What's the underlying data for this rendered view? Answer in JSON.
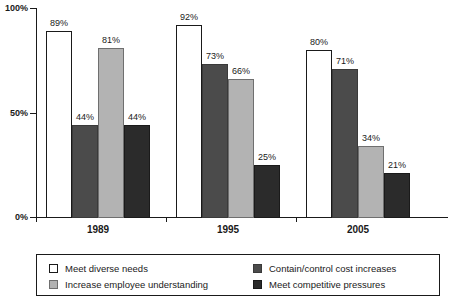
{
  "chart_data": {
    "type": "bar",
    "title": "",
    "subtitle": "",
    "xlabel": "",
    "ylabel": "",
    "categories": [
      "1989",
      "1995",
      "2005"
    ],
    "ylim": [
      0,
      100
    ],
    "yticks": [
      "0%",
      "50%",
      "100%"
    ],
    "ytick_values": [
      0,
      50,
      100
    ],
    "grid": false,
    "legend_position": "bottom",
    "value_label_suffix": "%",
    "series": [
      {
        "name": "Meet diverse needs",
        "swatch": "s0",
        "color": "#ffffff",
        "values": [
          89,
          92,
          80
        ],
        "labels": [
          "89%",
          "92%",
          "80%"
        ]
      },
      {
        "name": "Contain/control cost increases",
        "swatch": "s1",
        "color": "#4b4b4b",
        "values": [
          44,
          73,
          71
        ],
        "labels": [
          "44%",
          "73%",
          "71%"
        ]
      },
      {
        "name": "Increase employee understanding",
        "swatch": "s2",
        "color": "#b3b3b3",
        "values": [
          81,
          66,
          34
        ],
        "labels": [
          "81%",
          "66%",
          "34%"
        ]
      },
      {
        "name": "Meet competitive pressures",
        "swatch": "s3",
        "color": "#2b2b2b",
        "values": [
          44,
          25,
          21
        ],
        "labels": [
          "44%",
          "25%",
          "21%"
        ]
      }
    ]
  },
  "axis": {
    "y_ticks": [
      {
        "label": "100%",
        "value": 100
      },
      {
        "label": "50%",
        "value": 50
      },
      {
        "label": "0%",
        "value": 0
      }
    ],
    "x_groups": [
      {
        "label": "1989"
      },
      {
        "label": "1995"
      },
      {
        "label": "2005"
      }
    ]
  },
  "legend": {
    "entries": [
      {
        "label": "Meet diverse needs",
        "swatch": "s0",
        "column": 0,
        "row": 0
      },
      {
        "label": "Increase employee understanding",
        "swatch": "s2",
        "column": 0,
        "row": 1
      },
      {
        "label": "Contain/control cost increases",
        "swatch": "s1",
        "column": 1,
        "row": 0
      },
      {
        "label": "Meet competitive pressures",
        "swatch": "s3",
        "column": 1,
        "row": 1
      }
    ]
  }
}
